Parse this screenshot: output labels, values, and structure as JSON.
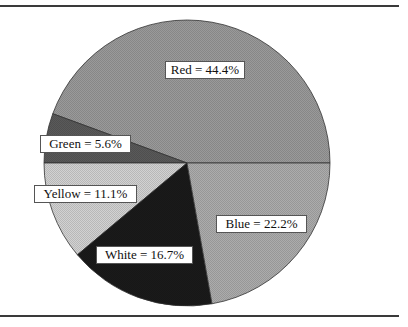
{
  "chart_data": {
    "type": "pie",
    "title": "",
    "slices": [
      {
        "label": "Red",
        "value": 44.4,
        "text": "Red = 44.4%",
        "fill": "#9a9a9a"
      },
      {
        "label": "Green",
        "value": 5.6,
        "text": "Green = 5.6%",
        "fill": "#5a5a5a"
      },
      {
        "label": "Yellow",
        "value": 11.1,
        "text": "Yellow = 11.1%",
        "fill": "#d2d2d2"
      },
      {
        "label": "White",
        "value": 16.7,
        "text": "White = 16.7%",
        "fill": "#1a1a1a"
      },
      {
        "label": "Blue",
        "value": 22.2,
        "text": "Blue = 22.2%",
        "fill": "#acacac"
      }
    ],
    "start_angle_deg": 0,
    "direction": "counter-clockwise",
    "legend": "none",
    "data_labels": "inside boxed"
  },
  "labels": {
    "red": "Red = 44.4%",
    "green": "Green = 5.6%",
    "yellow": "Yellow = 11.1%",
    "white": "White = 16.7%",
    "blue": "Blue = 22.2%"
  }
}
